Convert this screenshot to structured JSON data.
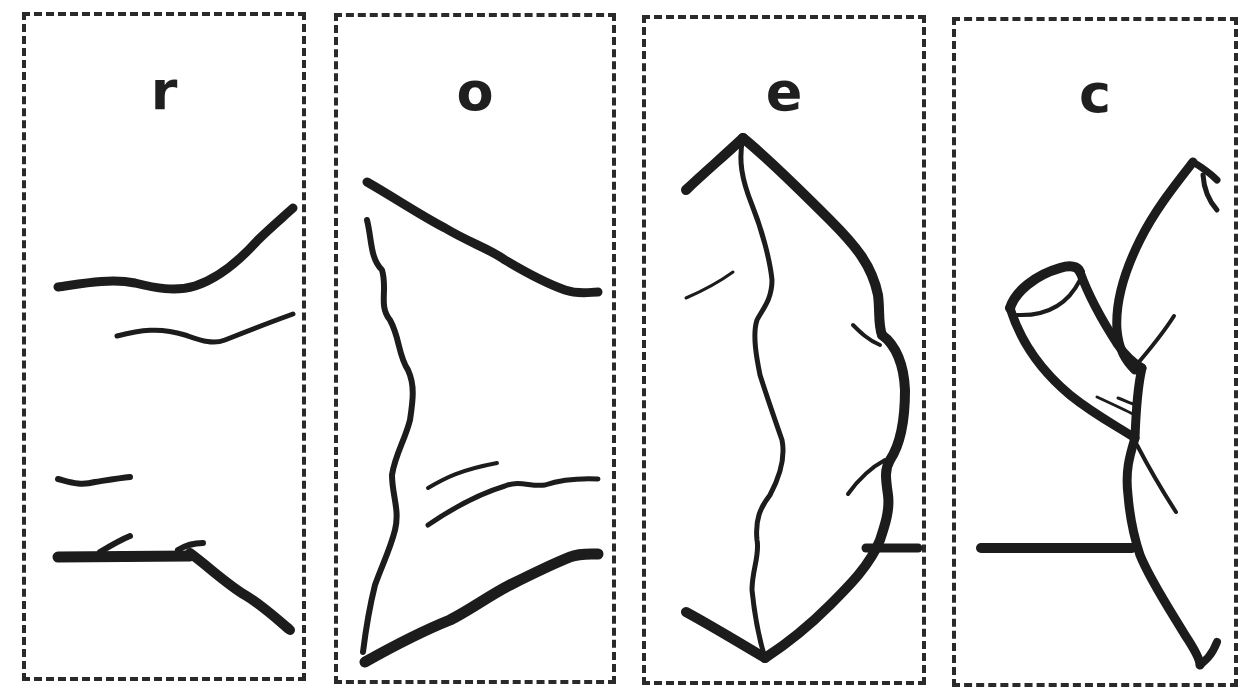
{
  "figure": {
    "panels": [
      {
        "id": "r",
        "label": "r",
        "subject": "tubular segment with upper and lower wall lines"
      },
      {
        "id": "o",
        "label": "o",
        "subject": "funnel-shaped opening with wavy left margin"
      },
      {
        "id": "e",
        "label": "e",
        "subject": "diamond/lobed shape with central wavy seam"
      },
      {
        "id": "c",
        "label": "c",
        "subject": "curved structure with cut tube stub"
      }
    ],
    "colors": {
      "ink": "#1c1c1c",
      "border": "#2a2a2a",
      "background": "#ffffff"
    }
  }
}
